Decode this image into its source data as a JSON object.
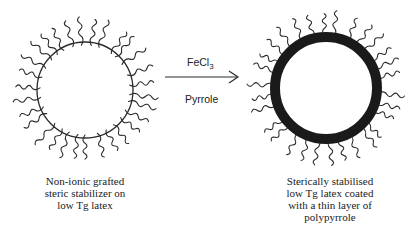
{
  "reagents": {
    "oxidant": "FeCl",
    "oxidant_subscript": "3",
    "monomer": "Pyrrole"
  },
  "left_particle": {
    "caption_lines": [
      "Non-ionic grafted",
      "steric stabilizer on",
      "low Tg latex"
    ],
    "chain_count": 30
  },
  "right_particle": {
    "caption_lines": [
      "Sterically stabilised",
      "low Tg latex coated",
      "with a thin layer of",
      "polypyrrole"
    ],
    "chain_count": 30
  },
  "colors": {
    "ink": "#2a2a2a",
    "shell": "#1a1a1a"
  }
}
